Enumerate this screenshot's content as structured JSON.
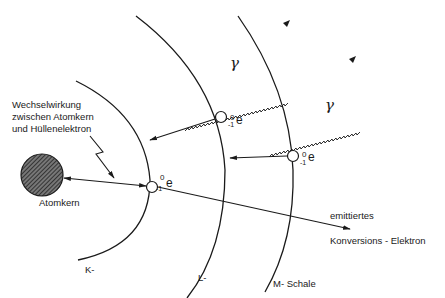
{
  "diagram": {
    "nucleus_label": "Atomkern",
    "interaction_label": {
      "line1": "Wechselwirkung",
      "line2": "zwischen Atomkern",
      "line3": "und Hüllenelektron"
    },
    "shells": {
      "k": "K-",
      "l": "L-",
      "m": "M- Schale"
    },
    "electron_symbol": {
      "base": "e",
      "mass": "0",
      "charge": "-1"
    },
    "gamma": "γ",
    "emitted_label": {
      "line1": "emittiertes",
      "line2": "Konversions - Elektron"
    }
  }
}
